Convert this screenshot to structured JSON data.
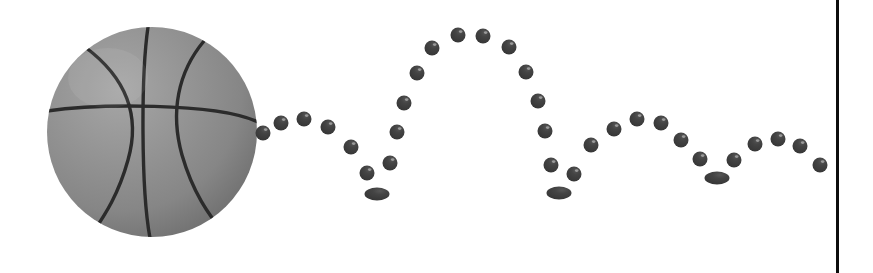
{
  "scene": {
    "title": "Bouncing basketball stroboscopic motion trail",
    "canvas": {
      "width": 873,
      "height": 273
    },
    "background_color": "#ffffff",
    "description": "A large grey basketball at the left with a stroboscopic trail of small dark spheres tracing four decaying bounce arcs to the right, ending at a vertical black boundary line."
  },
  "basketball": {
    "label": "basketball",
    "center_x": 152,
    "center_y": 132,
    "radius": 105,
    "fill_color": "#8a8a8a",
    "highlight_color": "#a3a3a3",
    "shadow_color": "#6e6e6e",
    "seam_color": "#2b2b2b",
    "seam_width": 3,
    "seams": [
      "vertical-center-seam",
      "horizontal-curved-seam",
      "left-side-curved-seam",
      "right-side-curved-seam"
    ]
  },
  "trail": {
    "label": "motion-trail",
    "dot_color": "#3a3a3a",
    "dot_highlight_color": "#5c5c5c",
    "dot_radius": 7.5,
    "count": 37,
    "dots": [
      {
        "x": 263,
        "y": 133,
        "rx": 7.5,
        "ry": 7.5,
        "flat": false
      },
      {
        "x": 281,
        "y": 123,
        "rx": 7.5,
        "ry": 7.5,
        "flat": false
      },
      {
        "x": 304,
        "y": 119,
        "rx": 7.5,
        "ry": 7.5,
        "flat": false
      },
      {
        "x": 328,
        "y": 127,
        "rx": 7.5,
        "ry": 7.5,
        "flat": false
      },
      {
        "x": 351,
        "y": 147,
        "rx": 7.5,
        "ry": 7.5,
        "flat": false
      },
      {
        "x": 367,
        "y": 173,
        "rx": 7.5,
        "ry": 7.5,
        "flat": false
      },
      {
        "x": 377,
        "y": 194,
        "rx": 12.5,
        "ry": 6.5,
        "flat": true
      },
      {
        "x": 390,
        "y": 163,
        "rx": 7.5,
        "ry": 7.5,
        "flat": false
      },
      {
        "x": 397,
        "y": 132,
        "rx": 7.5,
        "ry": 7.5,
        "flat": false
      },
      {
        "x": 404,
        "y": 103,
        "rx": 7.5,
        "ry": 7.5,
        "flat": false
      },
      {
        "x": 417,
        "y": 73,
        "rx": 7.5,
        "ry": 7.5,
        "flat": false
      },
      {
        "x": 432,
        "y": 48,
        "rx": 7.5,
        "ry": 7.5,
        "flat": false
      },
      {
        "x": 458,
        "y": 35,
        "rx": 7.5,
        "ry": 7.5,
        "flat": false
      },
      {
        "x": 483,
        "y": 36,
        "rx": 7.5,
        "ry": 7.5,
        "flat": false
      },
      {
        "x": 509,
        "y": 47,
        "rx": 7.5,
        "ry": 7.5,
        "flat": false
      },
      {
        "x": 526,
        "y": 72,
        "rx": 7.5,
        "ry": 7.5,
        "flat": false
      },
      {
        "x": 538,
        "y": 101,
        "rx": 7.5,
        "ry": 7.5,
        "flat": false
      },
      {
        "x": 545,
        "y": 131,
        "rx": 7.5,
        "ry": 7.5,
        "flat": false
      },
      {
        "x": 551,
        "y": 165,
        "rx": 7.5,
        "ry": 7.5,
        "flat": false
      },
      {
        "x": 559,
        "y": 193,
        "rx": 12.5,
        "ry": 6.5,
        "flat": true
      },
      {
        "x": 574,
        "y": 174,
        "rx": 7.5,
        "ry": 7.5,
        "flat": false
      },
      {
        "x": 591,
        "y": 145,
        "rx": 7.5,
        "ry": 7.5,
        "flat": false
      },
      {
        "x": 614,
        "y": 129,
        "rx": 7.5,
        "ry": 7.5,
        "flat": false
      },
      {
        "x": 637,
        "y": 119,
        "rx": 7.5,
        "ry": 7.5,
        "flat": false
      },
      {
        "x": 661,
        "y": 123,
        "rx": 7.5,
        "ry": 7.5,
        "flat": false
      },
      {
        "x": 681,
        "y": 140,
        "rx": 7.5,
        "ry": 7.5,
        "flat": false
      },
      {
        "x": 700,
        "y": 159,
        "rx": 7.5,
        "ry": 7.5,
        "flat": false
      },
      {
        "x": 717,
        "y": 178,
        "rx": 12.5,
        "ry": 6.5,
        "flat": true
      },
      {
        "x": 734,
        "y": 160,
        "rx": 7.5,
        "ry": 7.5,
        "flat": false
      },
      {
        "x": 755,
        "y": 144,
        "rx": 7.5,
        "ry": 7.5,
        "flat": false
      },
      {
        "x": 778,
        "y": 139,
        "rx": 7.5,
        "ry": 7.5,
        "flat": false
      },
      {
        "x": 800,
        "y": 146,
        "rx": 7.5,
        "ry": 7.5,
        "flat": false
      },
      {
        "x": 820,
        "y": 165,
        "rx": 7.5,
        "ry": 7.5,
        "flat": false
      }
    ]
  },
  "boundary_line": {
    "label": "right-boundary-line",
    "x": 836,
    "y_top": 0,
    "y_bottom": 273,
    "width": 3,
    "color": "#0d0d0d"
  }
}
